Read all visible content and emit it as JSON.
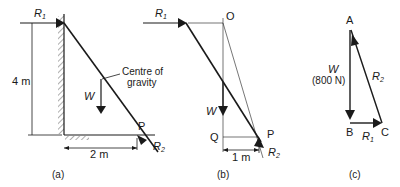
{
  "diagram": {
    "panels": [
      {
        "id": "a",
        "caption": "(a)",
        "labels": {
          "r1": "R",
          "r1_sub": "1",
          "height": "4 m",
          "width": "2 m",
          "weight": "W",
          "cog_line1": "Centre of",
          "cog_line2": "gravity",
          "point": "P",
          "r2": "R",
          "r2_sub": "2"
        }
      },
      {
        "id": "b",
        "caption": "(b)",
        "labels": {
          "r1": "R",
          "r1_sub": "1",
          "o": "O",
          "weight": "W",
          "q": "Q",
          "point": "P",
          "distance": "1 m",
          "r2": "R",
          "r2_sub": "2"
        }
      },
      {
        "id": "c",
        "caption": "(c)",
        "labels": {
          "a": "A",
          "b": "B",
          "c": "C",
          "weight": "W",
          "weight_value": "(800 N)",
          "r1": "R",
          "r1_sub": "1",
          "r2": "R",
          "r2_sub": "2"
        }
      }
    ]
  }
}
